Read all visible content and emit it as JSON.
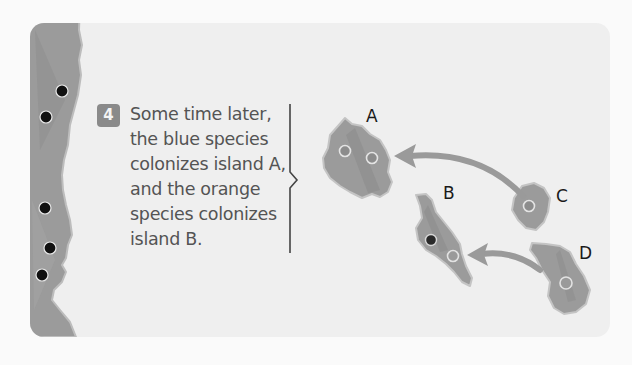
{
  "figure": {
    "step_number": "4",
    "caption_lines": [
      "Some time later,",
      "the blue species",
      "colonizes island A,",
      "and the orange",
      "species colonizes",
      "island B."
    ],
    "islands": [
      {
        "label": "A",
        "label_x": 366,
        "label_y": 108
      },
      {
        "label": "B",
        "label_x": 443,
        "label_y": 185
      },
      {
        "label": "C",
        "label_x": 556,
        "label_y": 188
      },
      {
        "label": "D",
        "label_x": 579,
        "label_y": 245
      }
    ],
    "mainland_species_dots": 5,
    "colonization_arrows": [
      {
        "from": "C",
        "to": "A"
      },
      {
        "from": "D",
        "to": "B"
      }
    ],
    "colors": {
      "page_bg": "#fafafa",
      "card_bg": "#efefef",
      "land": "#9b9b9b",
      "land_dark": "#8a8a8a",
      "arrow": "#9a9a9a",
      "dot_dark": "#111111",
      "species_dot": "#8c8c8c",
      "species_ring": "#e0e0e0",
      "text": "#545454",
      "label": "#1a1a1a",
      "badge": "#8a8a8a"
    }
  }
}
